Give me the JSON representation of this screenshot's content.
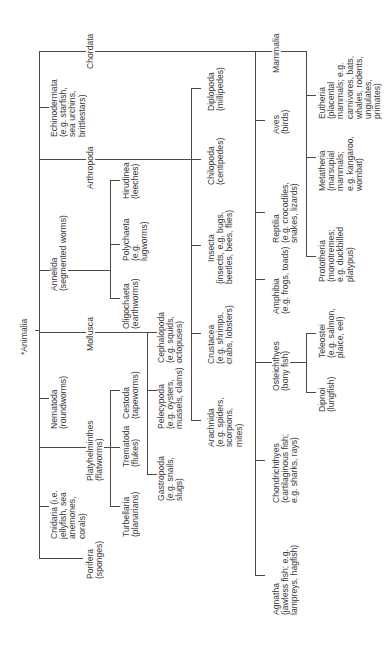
{
  "root": {
    "label": "*Animalia"
  },
  "phyla": {
    "chordata": {
      "name": "Chordata"
    },
    "echinodermata": {
      "name": "Echinodermata",
      "desc": "(e.g. starfish,\nsea urchins,\nbrittlestars)"
    },
    "arthropoda": {
      "name": "Arthropoda"
    },
    "annelida": {
      "name": "Annelida",
      "desc": "(segmented worms)"
    },
    "mollusca": {
      "name": "Mollusca"
    },
    "nematoda": {
      "name": "Nematoda",
      "desc": "(roundworms)"
    },
    "platyhelminthes": {
      "name": "Platyhelminthes",
      "desc": "(flatworms)"
    },
    "cnidaria": {
      "name": "Cnidaria (i.e.",
      "desc": "jellyfish, sea\nanemones,\ncorals)"
    },
    "porifera": {
      "name": "Porifera",
      "desc": "(sponges)"
    }
  },
  "chordata_classes": {
    "mammalia": {
      "name": "Mammalia"
    },
    "aves": {
      "name": "Aves",
      "desc": "(birds)"
    },
    "reptilia": {
      "name": "Reptilia",
      "desc": "(e.g. crocodiles,\nsnakes, lizards)"
    },
    "amphibia": {
      "name": "Amphibia",
      "desc": "(e.g. frogs, toads)"
    },
    "osteichthyes": {
      "name": "Osteichthyes",
      "desc": "(bony fish)"
    },
    "chondrichthyes": {
      "name": "Chondrichthyes",
      "desc": "(cartilaginous fish;\ne.g. sharks, rays)"
    },
    "agnatha": {
      "name": "Agnatha",
      "desc": "(jawless fish; e.g.\nlampreys, hagfish)"
    }
  },
  "mammalia_subclasses": {
    "eutheria": {
      "name": "Eutheria",
      "desc": "(placental\nmammals; e.g.\ncarnivores, bats,\nwhales, rodents,\nungulates,\nprimates)"
    },
    "metatheria": {
      "name": "Metatheria",
      "desc": "(marsupial\nmammals;\ne.g. kangaroo,\nwombat)"
    },
    "prototheria": {
      "name": "Prototheria",
      "desc": "(monotremes;\ne.g. duckbilled\nplatypus)"
    }
  },
  "osteichthyes_subclasses": {
    "teleostei": {
      "name": "Teleostei",
      "desc": "(e.g. salmon,\nplaice, eel)"
    },
    "dipnoi": {
      "name": "Dipnoi",
      "desc": "(lungfish)"
    }
  },
  "arthropoda_classes": {
    "diplopoda": {
      "name": "Diplopoda",
      "desc": "(millipedes)"
    },
    "chilopoda": {
      "name": "Chilopoda",
      "desc": "(centipedes)"
    },
    "insecta": {
      "name": "Insecta",
      "desc": "(insects, e.g. bugs,\nbeetles, bees, flies)"
    },
    "crustacea": {
      "name": "Crustacea",
      "desc": "(e.g. shrimps,\ncrabs, lobsters)"
    },
    "arachnida": {
      "name": "Arachnida",
      "desc": "(e.g. spiders,\nscorpions,\nmites)"
    }
  },
  "annelida_classes": {
    "hirudinea": {
      "name": "Hirudinea",
      "desc": "(leeches)"
    },
    "polychaeta": {
      "name": "Polychaeta",
      "desc": "(e.g.\nlugworms)"
    },
    "oligochaeta": {
      "name": "Oligochaeta",
      "desc": "(earthworms)"
    }
  },
  "mollusca_classes": {
    "cephalopoda": {
      "name": "Cephalopoda",
      "desc": "(e.g. squids,\noctopuses)"
    },
    "pelecypoda": {
      "name": "Pelecypoda",
      "desc": "(e.g. oysters,\nmussels, clams)"
    },
    "gastropoda": {
      "name": "Gastropoda",
      "desc": "(e.g. snails,\nslugs)"
    }
  },
  "platyhelminthes_classes": {
    "cestoda": {
      "name": "Cestoda",
      "desc": "(tapeworms)"
    },
    "trematoda": {
      "name": "Trematoda",
      "desc": "(flukes)"
    },
    "turbellaria": {
      "name": "Turbellaria",
      "desc": "(planarians)"
    }
  },
  "colors": {
    "line": "#4a4a4a",
    "text": "#3a3a3a",
    "background": "#ffffff"
  }
}
